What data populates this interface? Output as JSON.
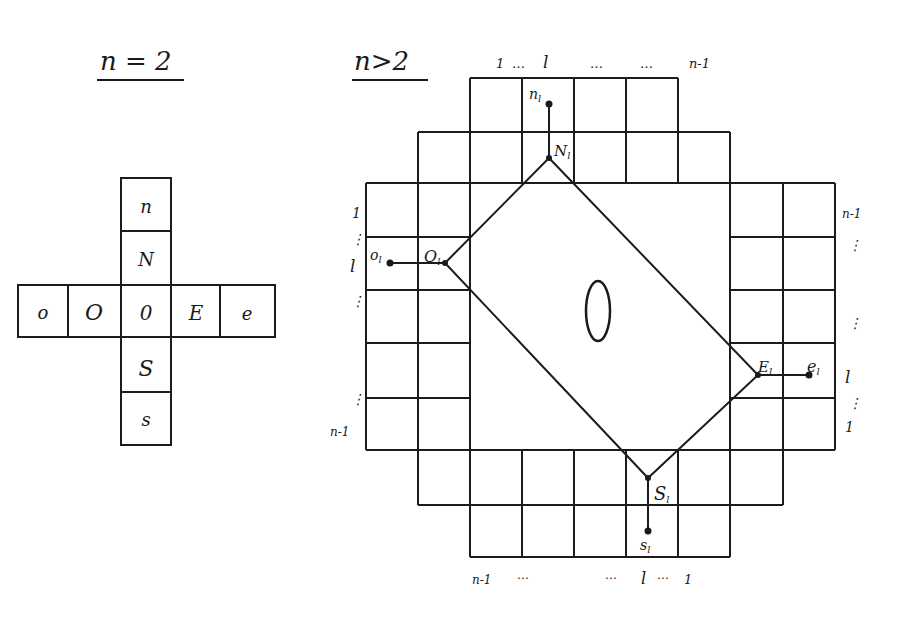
{
  "left_panel": {
    "title": "n = 2",
    "cells": {
      "n": "n",
      "N": "N",
      "o": "o",
      "O": "O",
      "center": "0",
      "E": "E",
      "e": "e",
      "S": "S",
      "s": "s"
    }
  },
  "right_panel": {
    "title": "n>2",
    "center_label": "0",
    "nodes": {
      "N": "N",
      "n": "n",
      "O": "O",
      "o": "o",
      "E": "E",
      "e": "e",
      "S": "S",
      "s": "s",
      "subscript": "l"
    },
    "top_labels": [
      "1 … l",
      "…",
      "…",
      "n-1"
    ],
    "top_label_1": "1",
    "top_label_dots1": "…",
    "top_label_l": "l",
    "top_label_dots2": "…",
    "top_label_dots3": "…",
    "top_label_n1": "n-1",
    "left_labels": {
      "one": "1",
      "dots1": "⋮",
      "l": "l",
      "dots2": "⋮",
      "dots3": "⋮",
      "n1": "n-1"
    },
    "right_labels": {
      "n1": "n-1",
      "dots1": "⋮",
      "dots2": "⋮",
      "l": "l",
      "dots3": "⋮",
      "one": "1"
    },
    "bottom_labels": {
      "n1": "n-1",
      "dots1": "⋯",
      "dots2": "⋯",
      "l": "l",
      "dots3": "⋯",
      "one": "1"
    }
  }
}
